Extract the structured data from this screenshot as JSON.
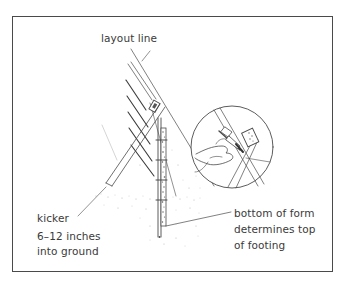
{
  "figure": {
    "type": "technical illustration"
  },
  "labels": {
    "layout_line": "layout line",
    "kicker": "kicker",
    "kicker_depth_line1": "6–12 inches",
    "kicker_depth_line2": "into ground",
    "bottom_form_line1": "bottom of form",
    "bottom_form_line2": "determines top",
    "bottom_form_line3": "of footing"
  },
  "colors": {
    "line": "#4a4a4a",
    "text": "#3a3a3a",
    "stipple": "#9a9a9a",
    "background": "#ffffff"
  }
}
